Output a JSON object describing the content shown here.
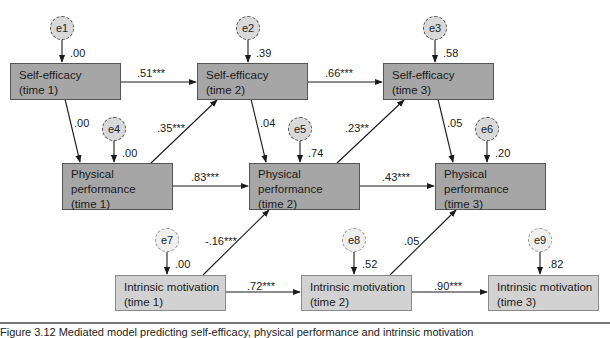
{
  "diagram": {
    "nodes": {
      "se1": {
        "line1": "Self-efficacy",
        "line2": "(time 1)"
      },
      "se2": {
        "line1": "Self-efficacy",
        "line2": "(time 2)"
      },
      "se3": {
        "line1": "Self-efficacy",
        "line2": "(time 3)"
      },
      "pp1": {
        "line1": "Physical",
        "line2": "performance",
        "line3": "(time 1)"
      },
      "pp2": {
        "line1": "Physical",
        "line2": "performance",
        "line3": "(time 2)"
      },
      "pp3": {
        "line1": "Physical",
        "line2": "performance",
        "line3": "(time 3)"
      },
      "im1": {
        "line1": "Intrinsic motivation",
        "line2": "(time 1)"
      },
      "im2": {
        "line1": "Intrinsic motivation",
        "line2": "(time 2)"
      },
      "im3": {
        "line1": "Intrinsic motivation",
        "line2": "(time 3)"
      }
    },
    "errors": {
      "e1": {
        "label": "e1",
        "value": ".00"
      },
      "e2": {
        "label": "e2",
        "value": ".39"
      },
      "e3": {
        "label": "e3",
        "value": ".58"
      },
      "e4": {
        "label": "e4",
        "value": ".00"
      },
      "e5": {
        "label": "e5",
        "value": ".74"
      },
      "e6": {
        "label": "e6",
        "value": ".20"
      },
      "e7": {
        "label": "e7",
        "value": ".00"
      },
      "e8": {
        "label": "e8",
        "value": ".52"
      },
      "e9": {
        "label": "e9",
        "value": ".82"
      }
    },
    "paths": {
      "se1_se2": ".51***",
      "se2_se3": ".66***",
      "se1_pp1": ".00",
      "pp1_se2": ".35***",
      "se2_pp2": ".04",
      "pp2_se3": ".23**",
      "se3_pp3": ".05",
      "pp1_pp2": ".83***",
      "pp2_pp3": ".43***",
      "im1_pp2": "-.16***",
      "im2_pp3": ".05",
      "im1_im2": ".72***",
      "im2_im3": ".90***"
    },
    "colors": {
      "dark_box": "#a6a6a6",
      "light_box": "#d2d2d2",
      "error_fill": "#d9d9d9",
      "line": "#1a1a1a"
    }
  },
  "caption": {
    "text": "Figure 3.12  Mediated model predicting self-efficacy, physical performance and intrinsic motivation"
  }
}
